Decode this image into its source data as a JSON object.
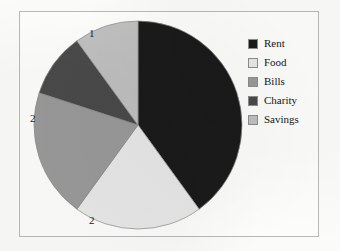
{
  "chart_data": {
    "type": "pie",
    "title": "",
    "categories": [
      "Rent",
      "Food",
      "Bills",
      "Charity",
      "Savings"
    ],
    "values": [
      4,
      2,
      2,
      1,
      1
    ],
    "total": 10,
    "data_labels": [
      "4",
      "2",
      "2",
      "1",
      "1"
    ],
    "colors": [
      "#1a1a1a",
      "#e8e8e8",
      "#9a9a9a",
      "#4a4a4a",
      "#c0c0c0"
    ],
    "legend_position": "right",
    "grid": false,
    "start_angle_deg": 0,
    "direction": "clockwise",
    "slices": [
      {
        "label": "Rent",
        "value": 4,
        "data_label": "4",
        "color": "#1a1a1a",
        "percent": 40,
        "sweep_deg": 144
      },
      {
        "label": "Food",
        "value": 2,
        "data_label": "2",
        "color": "#e8e8e8",
        "percent": 20,
        "sweep_deg": 72
      },
      {
        "label": "Bills",
        "value": 2,
        "data_label": "2",
        "color": "#9a9a9a",
        "percent": 20,
        "sweep_deg": 72
      },
      {
        "label": "Charity",
        "value": 1,
        "data_label": "1",
        "color": "#4a4a4a",
        "percent": 10,
        "sweep_deg": 36
      },
      {
        "label": "Savings",
        "value": 1,
        "data_label": "1",
        "color": "#c0c0c0",
        "percent": 10,
        "sweep_deg": 36
      }
    ]
  },
  "legend": {
    "items": [
      {
        "label": "Rent",
        "color": "#1a1a1a"
      },
      {
        "label": "Food",
        "color": "#e8e8e8"
      },
      {
        "label": "Bills",
        "color": "#9a9a9a"
      },
      {
        "label": "Charity",
        "color": "#4a4a4a"
      },
      {
        "label": "Savings",
        "color": "#c0c0c0"
      }
    ]
  },
  "frame": {
    "border_color": "#b9b9b9",
    "background": "#fdfdfc"
  }
}
